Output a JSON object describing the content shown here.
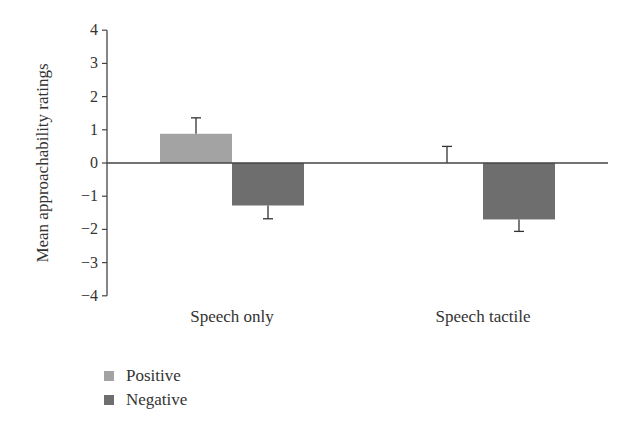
{
  "chart_data": {
    "type": "bar",
    "title": "",
    "xlabel": "",
    "ylabel": "Mean approachability ratings",
    "ylim": [
      -4,
      4
    ],
    "yticks": [
      4,
      3,
      2,
      1,
      0,
      -1,
      -2,
      -3,
      -4
    ],
    "ytick_labels": [
      "4",
      "3",
      "2",
      "1",
      "0",
      "−1",
      "−2",
      "−3",
      "−4"
    ],
    "categories": [
      "Speech only",
      "Speech tactile"
    ],
    "series": [
      {
        "name": "Positive",
        "color": "#a3a3a3",
        "values": [
          0.88,
          0.0
        ],
        "error": [
          0.48,
          0.5
        ]
      },
      {
        "name": "Negative",
        "color": "#6e6e6e",
        "values": [
          -1.28,
          -1.7
        ],
        "error": [
          0.4,
          0.36
        ]
      }
    ],
    "grid": false,
    "legend_position": "bottom-left"
  },
  "legend": {
    "items": [
      {
        "label": "Positive",
        "color": "#a3a3a3"
      },
      {
        "label": "Negative",
        "color": "#6e6e6e"
      }
    ]
  }
}
